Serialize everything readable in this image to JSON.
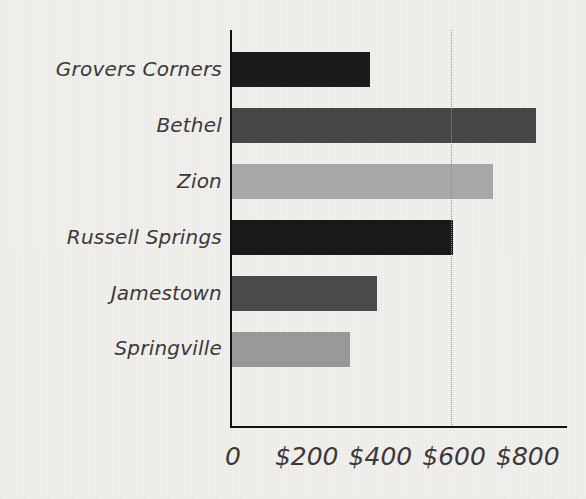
{
  "chart_data": {
    "type": "bar",
    "orientation": "horizontal",
    "title": "",
    "xlabel": "",
    "ylabel": "",
    "categories": [
      "Grovers Corners",
      "Bethel",
      "Zion",
      "Russell Springs",
      "Jamestown",
      "Springville"
    ],
    "values": [
      380,
      830,
      715,
      605,
      400,
      325
    ],
    "bar_colors": [
      "#1b1b1b",
      "#474747",
      "#a9a9a9",
      "#191919",
      "#4b4b4b",
      "#9a9a9a"
    ],
    "xlim": [
      0,
      900
    ],
    "tick_values": [
      0,
      200,
      400,
      600,
      800
    ],
    "tick_labels": [
      "0",
      "$200",
      "$400",
      "$600",
      "$800"
    ],
    "gridlines": [
      "600"
    ],
    "grid": "single dotted vertical gridline at $600",
    "legend": "none",
    "background_color": "#f1f0ed",
    "axis_color": "#111111",
    "text_color": "#3a3a3a"
  }
}
